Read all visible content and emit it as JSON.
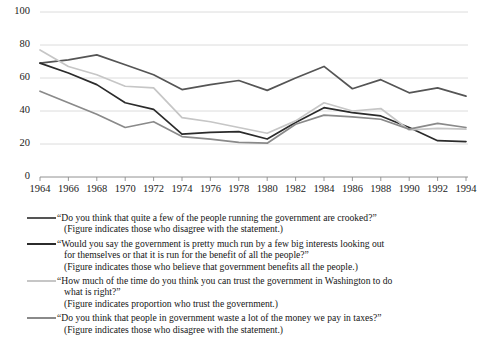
{
  "chart_data": {
    "type": "line",
    "title": "",
    "xlabel": "",
    "ylabel": "",
    "ylim": [
      0,
      100
    ],
    "yticks": [
      0,
      20,
      40,
      60,
      80,
      100
    ],
    "grid": true,
    "legend_position": "below",
    "categories": [
      1964,
      1966,
      1968,
      1970,
      1972,
      1974,
      1976,
      1978,
      1980,
      1982,
      1984,
      1986,
      1988,
      1990,
      1992,
      1994
    ],
    "x": [
      "1964",
      "1966",
      "1968",
      "1970",
      "1972",
      "1974",
      "1976",
      "1978",
      "1980",
      "1982",
      "1984",
      "1986",
      "1988",
      "1990",
      "1992",
      "1994"
    ],
    "series": [
      {
        "name": "crooked",
        "color": "#555555",
        "label": "“Do you think that quite a few of the people running the government are crooked?”",
        "sublabel": "(Figure indicates those who disagree with the statement.)",
        "values": [
          69,
          71,
          74,
          68,
          62,
          53,
          56,
          58.5,
          52.5,
          60,
          67,
          53.5,
          59,
          51,
          54,
          49
        ]
      },
      {
        "name": "big-interests",
        "color": "#2b2b2b",
        "label_line1": "“Would you say the government is pretty much run by a few big interests looking out",
        "label_line2": "for themselves or that it is run for the benefit of all the people?”",
        "sublabel": "(Figure indicates those who believe that government benefits all the people.)",
        "values": [
          69,
          63,
          56,
          45,
          41,
          26,
          27,
          27.5,
          23,
          33,
          42,
          39,
          37,
          30,
          22,
          21.5
        ]
      },
      {
        "name": "trust-government",
        "color": "#c6c6c6",
        "label_line1": "“How much of the time do you think you can trust the government in Washington to do",
        "label_line2": "what is right?”",
        "sublabel": "(Figure indicates proportion who trust the government.)",
        "values": [
          77,
          67,
          62,
          55,
          54,
          36,
          33.5,
          30,
          26.5,
          34,
          45,
          40,
          41.5,
          28.5,
          29.5,
          29
        ]
      },
      {
        "name": "waste-taxes",
        "color": "#8a8a8a",
        "label": "“Do you think that people in government waste a lot of the money we pay in taxes?”",
        "sublabel": "(Figure indicates those who disagree with the statement.)",
        "values": [
          52,
          45,
          38,
          30,
          33.5,
          24.5,
          23,
          21,
          20.5,
          32,
          37.5,
          36.5,
          35,
          29,
          32.5,
          30
        ]
      }
    ]
  },
  "axis": {
    "y_tick_labels": [
      "100",
      "80",
      "60",
      "40",
      "20",
      "0"
    ],
    "x_tick_labels": [
      "1964",
      "1966",
      "1968",
      "1970",
      "1972",
      "1974",
      "1976",
      "1978",
      "1980",
      "1982",
      "1984",
      "1986",
      "1988",
      "1990",
      "1992",
      "1994"
    ]
  },
  "legend": {
    "entries": [
      {
        "swatch_color": "#555555",
        "lines": [
          "“Do you think that quite a few of the people running the government are crooked?”",
          "(Figure indicates those who disagree with the statement.)"
        ]
      },
      {
        "swatch_color": "#2b2b2b",
        "lines": [
          "“Would you say the government is pretty much run by a few big interests looking out",
          "for themselves or that it is run for the benefit of all the people?”",
          "(Figure indicates those who believe that government benefits all the people.)"
        ]
      },
      {
        "swatch_color": "#c6c6c6",
        "lines": [
          "“How much of the time do you think you can trust the government in Washington to do",
          "what is right?”",
          "(Figure indicates proportion who trust the government.)"
        ]
      },
      {
        "swatch_color": "#8a8a8a",
        "lines": [
          "“Do you think that people in government waste a lot of the money we pay in taxes?”",
          "(Figure indicates those who disagree with the statement.)"
        ]
      }
    ]
  }
}
